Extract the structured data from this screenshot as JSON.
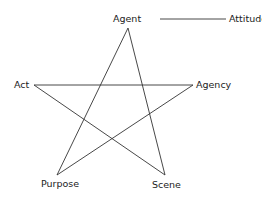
{
  "diagram": {
    "nodes": {
      "agent": "Agent",
      "attitude": "Attitude",
      "act": "Act",
      "agency": "Agency",
      "purpose": "Purpose",
      "scene": "Scene"
    },
    "edges": [
      [
        "Agent",
        "Purpose"
      ],
      [
        "Agent",
        "Scene"
      ],
      [
        "Act",
        "Agency"
      ],
      [
        "Act",
        "Scene"
      ],
      [
        "Agency",
        "Purpose"
      ],
      [
        "Agent",
        "Attitude"
      ]
    ],
    "line_color": "#333333"
  }
}
